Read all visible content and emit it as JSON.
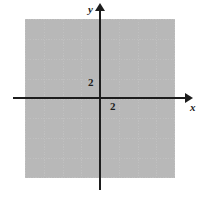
{
  "figure": {
    "name": "cartesian-coordinate-grid",
    "background_color": "#ffffff",
    "grid": {
      "color": "#c0c0c0",
      "style": "dotted",
      "cols": 8,
      "rows": 8,
      "cell_px": 18.7,
      "left_px": 25,
      "top_px": 19,
      "width_px": 150,
      "height_px": 159
    },
    "axes": {
      "color": "#1d1d1d",
      "origin_px": {
        "x": 100,
        "y": 98
      },
      "x_axis": {
        "label": "x",
        "arrow": "right",
        "tick_labels": [
          "2"
        ]
      },
      "y_axis": {
        "label": "y",
        "arrow": "up",
        "tick_labels": [
          "2"
        ]
      }
    },
    "labels": {
      "y_axis_name": "y",
      "x_axis_name": "x",
      "y_tick_two": "2",
      "x_tick_two": "2"
    }
  }
}
